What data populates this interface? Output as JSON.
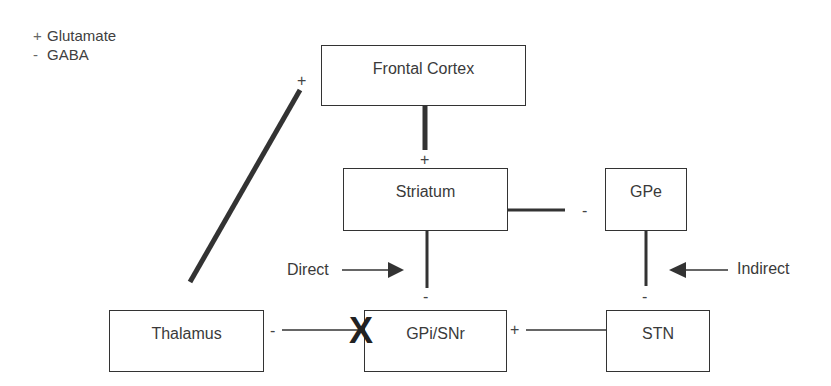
{
  "legend": {
    "items": [
      {
        "symbol": "+",
        "label": "Glutamate"
      },
      {
        "symbol": "-",
        "label": "GABA"
      }
    ]
  },
  "nodes": {
    "frontal_cortex": "Frontal Cortex",
    "striatum": "Striatum",
    "gpe": "GPe",
    "thalamus": "Thalamus",
    "gpi_snr": "GPi/SNr",
    "stn": "STN"
  },
  "pathway_labels": {
    "direct": "Direct",
    "indirect": "Indirect"
  },
  "signs": {
    "thalamus_to_cortex": "+",
    "cortex_to_striatum": "+",
    "striatum_to_gpe": "-",
    "striatum_to_gpi": "-",
    "gpe_to_stn": "-",
    "gpi_to_thalamus": "-",
    "stn_to_gpi": "+"
  },
  "markers": {
    "blocked": "X"
  },
  "colors": {
    "line": "#333333",
    "text": "#3a3a3a"
  }
}
